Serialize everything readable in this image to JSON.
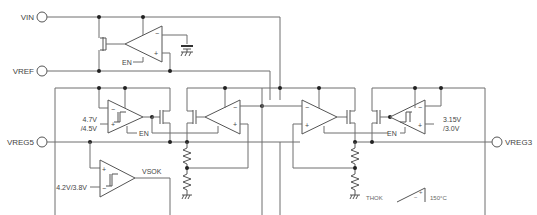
{
  "diagram": {
    "type": "circuit-schematic",
    "pins": {
      "vin": "VIN",
      "vref": "VREF",
      "vreg5": "VREG5",
      "vreg3": "VREG3"
    },
    "labels": {
      "en_ref": "EN",
      "en_sw5": "EN",
      "en_ldo3": "EN",
      "ldo5_thr_hi": "4.7V",
      "ldo5_thr_lo": "/4.5V",
      "vsok_thr": "4.2V/3.8V",
      "vsok": "VSOK",
      "ldo3_thr_hi": "3.15V",
      "ldo3_thr_lo": "/3.0V",
      "thok": "THOK",
      "thermal": "150°C"
    },
    "amp_signs": {
      "minus": "−",
      "plus": "+"
    },
    "colors": {
      "wire": "#6e6e6e",
      "node": "#222222",
      "text": "#444444",
      "background": "#ffffff"
    }
  }
}
